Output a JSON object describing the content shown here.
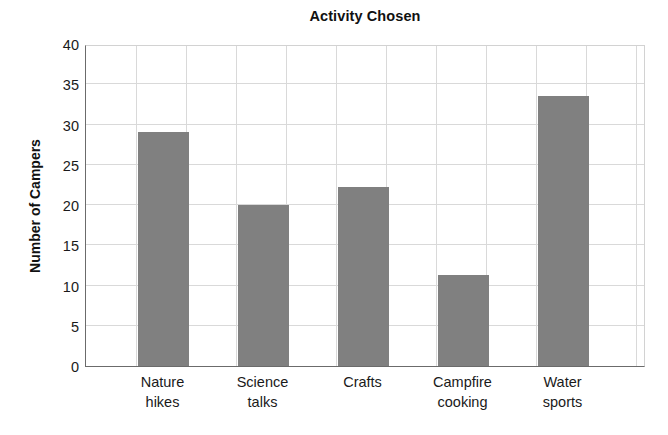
{
  "chart_data": {
    "type": "bar",
    "title": "Activity Chosen",
    "xlabel": "",
    "ylabel": "Number of Campers",
    "categories": [
      "Nature hikes",
      "Science talks",
      "Crafts",
      "Campfire cooking",
      "Water sports"
    ],
    "category_lines": [
      [
        "Nature",
        "hikes"
      ],
      [
        "Science",
        "talks"
      ],
      [
        "Crafts",
        ""
      ],
      [
        "Campfire",
        "cooking"
      ],
      [
        "Water",
        "sports"
      ]
    ],
    "values": [
      29.1,
      20.0,
      22.3,
      11.3,
      33.6
    ],
    "ylim": [
      0,
      40
    ],
    "ytick_step": 5,
    "yticks": [
      "0",
      "5",
      "10",
      "15",
      "20",
      "25",
      "30",
      "35",
      "40"
    ],
    "grid": true,
    "grid_vertical": true,
    "legend": null,
    "bar_color": "#808080",
    "grid_color": "#d9d9d9",
    "axis_color": "#6b6b6b",
    "text_color": "#1a1a1a",
    "background": "#ffffff"
  }
}
